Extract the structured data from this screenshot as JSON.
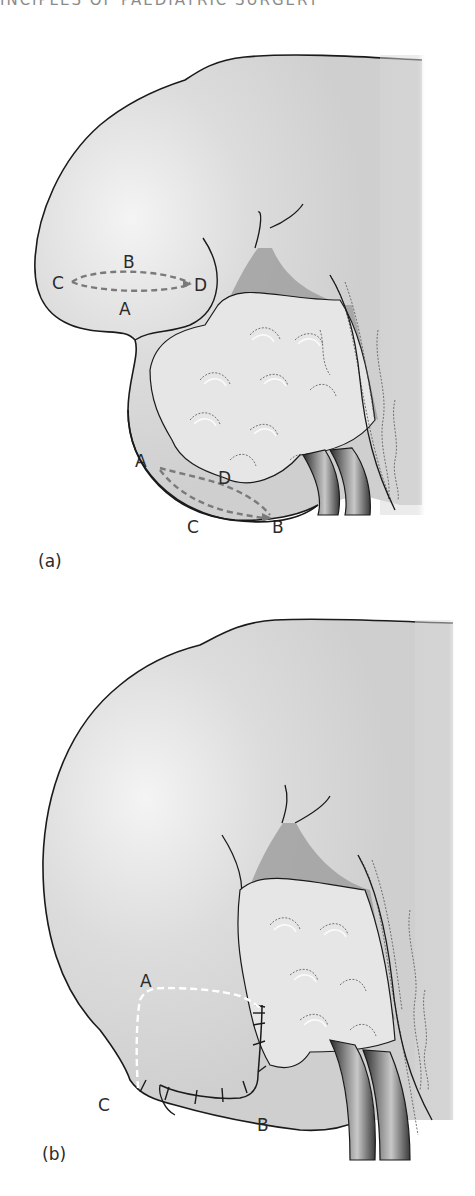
{
  "page": {
    "running_head": "INCIPLES OF PAEDIATRIC SURGERY"
  },
  "figure": {
    "panel_a": {
      "label": "(a)",
      "flap_upper": {
        "B": "B",
        "C": "C",
        "D": "D",
        "A": "A"
      },
      "flap_lower": {
        "A": "A",
        "D": "D",
        "C": "C",
        "B": "B"
      }
    },
    "panel_b": {
      "label": "(b)",
      "points": {
        "A": "A",
        "C": "C",
        "B": "B"
      }
    },
    "colors": {
      "organ_fill": "#d9d9d9",
      "outline": "#1a1a1a",
      "dashed_incision": "#7a7a7a",
      "dashed_white": "#ffffff",
      "vessel_dark": "#3a3a3a",
      "recess_shadow": "#9a9a9a"
    }
  }
}
